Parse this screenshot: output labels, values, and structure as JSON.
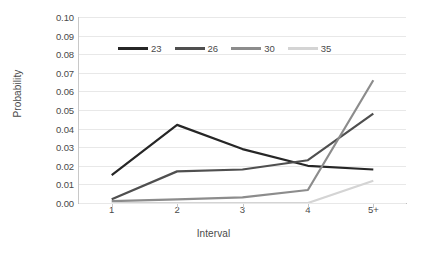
{
  "chart_data": {
    "type": "line",
    "title": "",
    "xlabel": "Interval",
    "ylabel": "Probability",
    "categories": [
      "1",
      "2",
      "3",
      "4",
      "5+"
    ],
    "ylim": [
      0.0,
      0.1
    ],
    "ytick_step": 0.01,
    "ytick_labels": [
      "0.10",
      "0.09",
      "0.08",
      "0.07",
      "0.06",
      "0.05",
      "0.04",
      "0.03",
      "0.02",
      "0.01",
      "0.00"
    ],
    "ytick_values": [
      0.1,
      0.09,
      0.08,
      0.07,
      0.06,
      0.05,
      0.04,
      0.03,
      0.02,
      0.01,
      0.0
    ],
    "grid": true,
    "grid_axis": "y",
    "legend_position": "top-center",
    "series": [
      {
        "name": "23",
        "color": "#262626",
        "values": [
          0.015,
          0.042,
          0.029,
          0.02,
          0.018
        ]
      },
      {
        "name": "26",
        "color": "#4f4f4f",
        "values": [
          0.002,
          0.017,
          0.018,
          0.023,
          0.048
        ]
      },
      {
        "name": "30",
        "color": "#8c8c8c",
        "values": [
          0.001,
          0.002,
          0.003,
          0.007,
          0.066
        ]
      },
      {
        "name": "35",
        "color": "#d4d4d4",
        "values": [
          0.0,
          0.0,
          0.0,
          0.0,
          0.012
        ]
      }
    ]
  },
  "axis": {
    "y_title": "Probability",
    "x_title": "Interval"
  }
}
